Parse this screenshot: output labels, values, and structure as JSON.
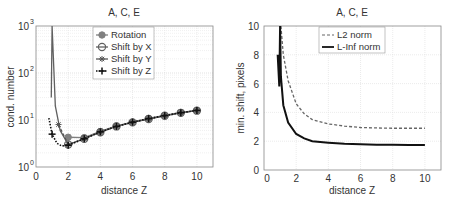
{
  "chart_data": [
    {
      "type": "line",
      "title": "A, C, E",
      "xlabel": "distance Z",
      "ylabel": "cond. number",
      "xlim": [
        0,
        11
      ],
      "ylim": [
        1,
        1000
      ],
      "yscale": "log",
      "grid": true,
      "legend_position": "upper center",
      "xticks": [
        "0",
        "2",
        "4",
        "6",
        "8",
        "10"
      ],
      "yticks": [
        "10^0",
        "10^1",
        "10^2",
        "10^3"
      ],
      "note": "Values are approximate visual readings (±10-20%), not ground truth.",
      "series": [
        {
          "name": "Rotation",
          "marker": "filled-circle",
          "color": "#808080",
          "x": [
            2,
            3,
            4,
            5,
            6,
            7,
            8,
            9,
            10
          ],
          "y": [
            4.3,
            4.2,
            5.7,
            7.5,
            9.0,
            10.8,
            12.5,
            14.5,
            16.0
          ]
        },
        {
          "name": "Shift by X",
          "marker": "open-circle",
          "color": "#606060",
          "x": [
            0.95,
            1.0,
            1.2,
            1.5,
            2,
            3,
            4,
            5,
            6,
            7,
            8,
            9,
            10
          ],
          "y": [
            30,
            1000,
            20,
            6,
            3.0,
            4.0,
            5.5,
            7.3,
            8.9,
            10.5,
            12.3,
            14.2,
            15.8
          ]
        },
        {
          "name": "Shift by Y",
          "marker": "star",
          "color": "#555555",
          "x": [
            1.4,
            2,
            3,
            4,
            5,
            6,
            7,
            8,
            9,
            10
          ],
          "y": [
            8,
            3.0,
            4.0,
            5.5,
            7.3,
            8.9,
            10.5,
            12.3,
            14.2,
            15.8
          ]
        },
        {
          "name": "Shift by Z",
          "marker": "plus",
          "line": "dotted",
          "color": "#111111",
          "x": [
            0.8,
            1.0,
            1.3,
            1.6,
            2,
            3,
            4,
            5,
            6,
            7,
            8,
            9,
            10
          ],
          "y": [
            11,
            5,
            3.2,
            2.8,
            2.9,
            4.0,
            5.6,
            7.3,
            9.0,
            10.7,
            12.4,
            14.3,
            16.0
          ]
        }
      ]
    },
    {
      "type": "line",
      "title": "A, C, E",
      "xlabel": "distance Z",
      "ylabel": "min. shift, pixels",
      "xlim": [
        0,
        11
      ],
      "ylim": [
        0,
        10
      ],
      "grid": true,
      "legend_position": "upper center",
      "xticks": [
        "0",
        "2",
        "4",
        "6",
        "8",
        "10"
      ],
      "yticks": [
        "0",
        "2",
        "4",
        "6",
        "8",
        "10"
      ],
      "note": "Values are approximate visual readings (±10-20%), not ground truth.",
      "series": [
        {
          "name": "L2 norm",
          "line": "dashed",
          "color": "#666666",
          "x": [
            1.05,
            1.2,
            1.5,
            2,
            2.5,
            3,
            4,
            5,
            6,
            7,
            8,
            9,
            10
          ],
          "y": [
            10,
            8,
            6.2,
            4.6,
            3.9,
            3.5,
            3.2,
            3.05,
            2.95,
            2.92,
            2.9,
            2.9,
            2.9
          ]
        },
        {
          "name": "L-Inf norm",
          "line": "solid",
          "color": "#111111",
          "x": [
            0.85,
            0.95,
            1.0,
            1.05,
            1.2,
            1.5,
            2,
            2.5,
            3,
            4,
            5,
            6,
            7,
            8,
            9,
            10
          ],
          "y": [
            8,
            5.8,
            10,
            6.5,
            4.5,
            3.3,
            2.5,
            2.2,
            2.0,
            1.9,
            1.82,
            1.78,
            1.76,
            1.75,
            1.74,
            1.73
          ]
        }
      ]
    }
  ],
  "left_chart": {
    "title": "A, C, E",
    "xlabel": "distance Z",
    "ylabel": "cond. number",
    "legend": [
      "Rotation",
      "Shift by X",
      "Shift by Y",
      "Shift by Z"
    ]
  },
  "right_chart": {
    "title": "A, C, E",
    "xlabel": "distance Z",
    "ylabel": "min. shift, pixels",
    "legend": [
      "L2 norm",
      "L-Inf norm"
    ]
  }
}
